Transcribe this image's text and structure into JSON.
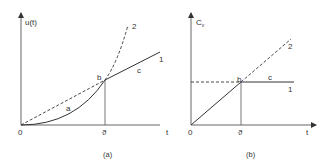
{
  "figure": {
    "panel_a": {
      "caption": "(a)",
      "y_axis_label": "u(t)",
      "x_axis_label": "t",
      "origin_label": "0",
      "theta_label": "ϑ",
      "point_label": "b",
      "segment_labels": {
        "a": "a",
        "c": "c"
      },
      "curve_labels": {
        "one": "1",
        "two": "2"
      }
    },
    "panel_b": {
      "caption": "(b)",
      "y_axis_label_main": "C",
      "y_axis_label_sub": "v",
      "x_axis_label": "t",
      "origin_label": "0",
      "theta_label": "ϑ",
      "point_label": "b",
      "segment_labels": {
        "c": "c"
      },
      "curve_labels": {
        "one": "1",
        "two": "2"
      }
    },
    "colors": {
      "line": "#333333",
      "axis": "#555555",
      "background": "#ffffff"
    }
  }
}
